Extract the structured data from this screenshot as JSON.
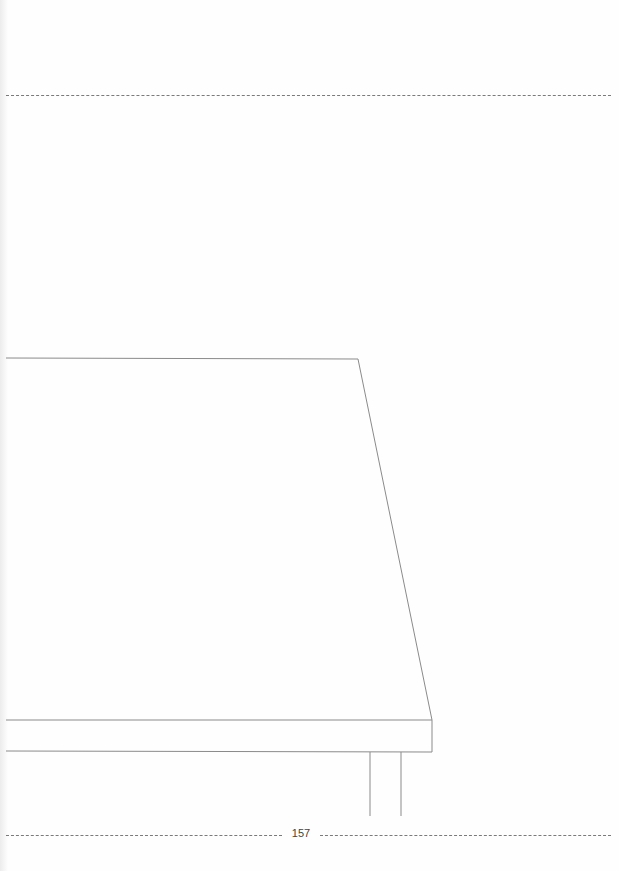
{
  "page": {
    "type": "coloring-page",
    "page_number": "157"
  },
  "colors": {
    "background": "#fefefe",
    "line": "#8a8a8a",
    "dash": "#7a7a7a",
    "text": "#444444"
  }
}
